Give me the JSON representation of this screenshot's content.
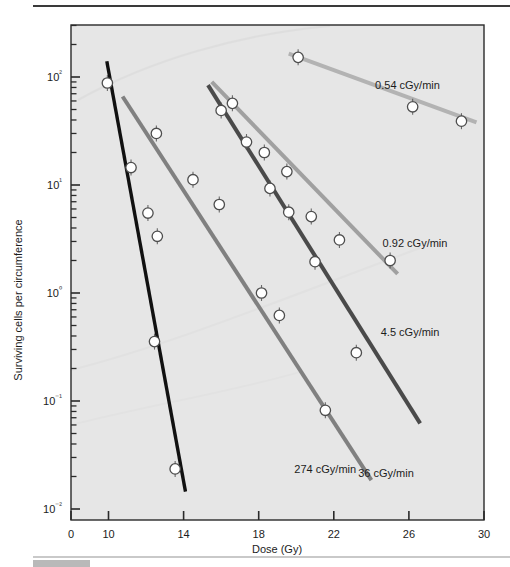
{
  "figure": {
    "kind": "semilog-survival-curve"
  },
  "chart_data": {
    "type": "line",
    "title": "",
    "subtitle": "",
    "xlabel": "Dose (Gy)",
    "ylabel": "Surviving cells per circumference",
    "x_scale": "linear-broken",
    "y_scale": "log10",
    "xlim": [
      0,
      30
    ],
    "ylim": [
      0.01,
      300
    ],
    "x_axis_break": "Axis compressed between 0 and 10; ticks 10-30 evenly spaced every 4 Gy",
    "xticks": [
      0,
      10,
      14,
      18,
      22,
      26,
      30
    ],
    "xticklabels": [
      "0",
      "10",
      "14",
      "18",
      "22",
      "26",
      "30"
    ],
    "yticks": [
      0.01,
      0.1,
      1,
      10,
      100
    ],
    "yticklabels": [
      "10⁻²",
      "10⁻¹",
      "10⁰",
      "10¹",
      "10²"
    ],
    "ytick_mantissas": [
      "10^-2",
      "10^-1",
      "10^0",
      "10^1",
      "10^2"
    ],
    "minor_ticks": "log decades 2-9 shown on y axis",
    "grid": false,
    "legend_position": "inline-labels-right-of-each-line",
    "marker": "open-circle-white-fill-dark-edge",
    "error_bars": "small vertical bars on several points",
    "series": [
      {
        "name": "274 cGy/min",
        "label": "274 cGy/min",
        "color": "#111111",
        "label_x": 19.9,
        "label_y": 0.0235,
        "line_from": [
          9.55,
          140
        ],
        "line_to": [
          14.1,
          0.0145
        ],
        "points": [
          {
            "x": 9.7,
            "y": 88
          },
          {
            "x": 11.2,
            "y": 14.5
          },
          {
            "x": 12.1,
            "y": 5.5
          },
          {
            "x": 12.6,
            "y": 3.35
          },
          {
            "x": 12.45,
            "y": 0.355
          },
          {
            "x": 13.55,
            "y": 0.0235
          }
        ]
      },
      {
        "name": "36 cGy/min",
        "label": "36 cGy/min",
        "color": "#808080",
        "label_x": 23.3,
        "label_y": 0.0215,
        "line_from": [
          10.75,
          66
        ],
        "line_to": [
          24.0,
          0.0185
        ],
        "points": [
          {
            "x": 12.55,
            "y": 30
          },
          {
            "x": 14.5,
            "y": 11.2
          },
          {
            "x": 15.9,
            "y": 6.6
          },
          {
            "x": 18.15,
            "y": 1.0
          },
          {
            "x": 19.1,
            "y": 0.62
          },
          {
            "x": 21.55,
            "y": 0.082
          }
        ]
      },
      {
        "name": "4.5 cGy/min",
        "label": "4.5 cGy/min",
        "color": "#4a4a4a",
        "label_x": 24.5,
        "label_y": 0.44,
        "line_from": [
          15.3,
          84
        ],
        "line_to": [
          26.6,
          0.062
        ],
        "points": [
          {
            "x": 16.0,
            "y": 49
          },
          {
            "x": 17.35,
            "y": 25
          },
          {
            "x": 18.6,
            "y": 9.3
          },
          {
            "x": 19.6,
            "y": 5.6
          },
          {
            "x": 21.0,
            "y": 1.95
          },
          {
            "x": 23.2,
            "y": 0.28
          }
        ]
      },
      {
        "name": "0.92 cGy/min",
        "label": "0.92 cGy/min",
        "color": "#a0a0a0",
        "label_x": 24.6,
        "label_y": 2.9,
        "line_from": [
          15.5,
          90
        ],
        "line_to": [
          25.4,
          1.5
        ],
        "points": [
          {
            "x": 16.6,
            "y": 57
          },
          {
            "x": 18.3,
            "y": 20
          },
          {
            "x": 19.5,
            "y": 13.3
          },
          {
            "x": 20.8,
            "y": 5.1
          },
          {
            "x": 22.3,
            "y": 3.1
          },
          {
            "x": 25.0,
            "y": 2.0
          }
        ]
      },
      {
        "name": "0.54 cGy/min",
        "label": "0.54 cGy/min",
        "color": "#b3b3b3",
        "label_x": 24.2,
        "label_y": 85,
        "line_from": [
          19.6,
          165
        ],
        "line_to": [
          29.6,
          38
        ],
        "points": [
          {
            "x": 20.1,
            "y": 152
          },
          {
            "x": 26.2,
            "y": 53
          },
          {
            "x": 28.8,
            "y": 39
          }
        ]
      }
    ]
  }
}
